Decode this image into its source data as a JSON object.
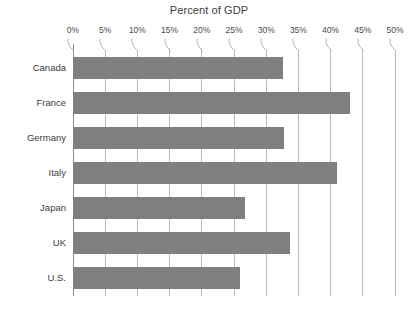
{
  "chart_data": {
    "type": "bar",
    "orientation": "horizontal",
    "title": "Percent of GDP",
    "xlabel": "",
    "ylabel": "",
    "categories": [
      "Canada",
      "France",
      "Germany",
      "Italy",
      "Japan",
      "UK",
      "U.S."
    ],
    "values": [
      32.6,
      43.0,
      32.8,
      41.0,
      26.7,
      33.7,
      26.0
    ],
    "xlim": [
      0,
      50
    ],
    "xticks": [
      0,
      5,
      10,
      15,
      20,
      25,
      30,
      35,
      40,
      45,
      50
    ],
    "xtick_labels": [
      "0%",
      "5%",
      "10%",
      "15%",
      "20%",
      "25%",
      "30%",
      "35%",
      "40%",
      "45%",
      "50%"
    ],
    "grid": true,
    "grid_axis": "x",
    "legend": false,
    "bar_color": "#7f7f7f",
    "grid_color": "#b9b9b9",
    "axis_color": "#8d8d8d",
    "text_color": "#3d3d3d",
    "background": "#ffffff"
  }
}
